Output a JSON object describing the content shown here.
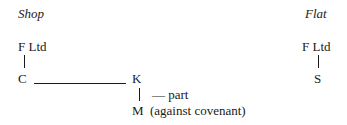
{
  "shop": {
    "heading": "Shop",
    "landlord": "F Ltd",
    "tenant": "C",
    "assignee": "K",
    "subtenant": "M",
    "sublet_note": "— part",
    "sublet_note2": "(against covenant)"
  },
  "flat": {
    "heading": "Flat",
    "landlord": "F Ltd",
    "tenant": "S"
  }
}
